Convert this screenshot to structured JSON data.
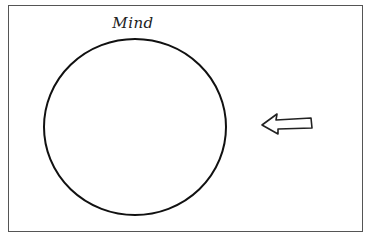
{
  "diagram": {
    "circle_label": "Mind",
    "shapes": {
      "circle": {
        "cx": 135,
        "cy": 127,
        "rx": 91,
        "ry": 88,
        "stroke": "#111111"
      },
      "arrow": {
        "direction": "left",
        "stroke": "#222222",
        "fill": "#ffffff"
      }
    },
    "frame": {
      "stroke": "#555555"
    }
  }
}
